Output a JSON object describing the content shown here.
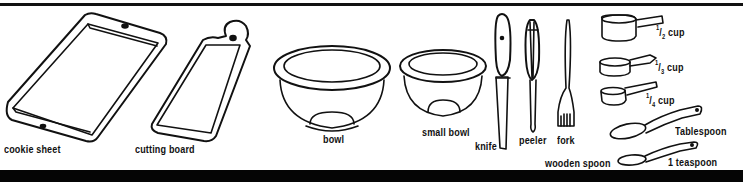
{
  "illustration": {
    "colors": {
      "ink": "#111111",
      "background": "#ffffff"
    },
    "items": [
      {
        "id": "cookie-sheet",
        "label": "cookie  sheet"
      },
      {
        "id": "cutting-board",
        "label": "cutting board"
      },
      {
        "id": "bowl",
        "label": "bowl"
      },
      {
        "id": "small-bowl",
        "label": "small bowl"
      },
      {
        "id": "knife",
        "label": "knife"
      },
      {
        "id": "peeler",
        "label": "peeler"
      },
      {
        "id": "fork",
        "label": "fork"
      },
      {
        "id": "wooden-spoon",
        "label": "wooden spoon"
      },
      {
        "id": "half-cup",
        "num": "1",
        "den": "2",
        "unit": "cup"
      },
      {
        "id": "third-cup",
        "num": "1",
        "den": "3",
        "unit": "cup"
      },
      {
        "id": "quarter-cup",
        "num": "1",
        "den": "4",
        "unit": "cup"
      },
      {
        "id": "tablespoon",
        "label": "Tablespoon"
      },
      {
        "id": "teaspoon",
        "label": "1 teaspoon"
      }
    ]
  }
}
